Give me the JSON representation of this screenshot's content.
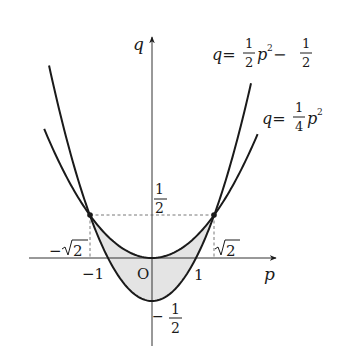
{
  "diagram": {
    "type": "function-graph",
    "axes": {
      "x_label": "p",
      "y_label": "q",
      "origin_label": "O"
    },
    "curves": [
      {
        "name": "steep-parabola",
        "equation_lhs": "q=",
        "coef_num": "1",
        "coef_den": "2",
        "var": "p",
        "exp": "2",
        "minus": "−",
        "const_num": "1",
        "const_den": "2",
        "formula": "q = 1/2 p^2 - 1/2"
      },
      {
        "name": "shallow-parabola",
        "equation_lhs": "q=",
        "coef_num": "1",
        "coef_den": "4",
        "var": "p",
        "exp": "2",
        "formula": "q = 1/4 p^2"
      }
    ],
    "tick_labels": {
      "x_neg_one": "−1",
      "x_one": "1",
      "x_neg_sqrt2_sign": "−",
      "x_neg_sqrt2_radicand": "2",
      "x_sqrt2_radicand": "2",
      "y_half_num": "1",
      "y_half_den": "2",
      "y_neg_half_sign": "−",
      "y_neg_half_num": "1",
      "y_neg_half_den": "2"
    },
    "intersections": [
      {
        "p": "-√2",
        "q": "1/2"
      },
      {
        "p": "√2",
        "q": "1/2"
      }
    ],
    "shaded_region": "between curves for -√2 ≤ p ≤ √2",
    "colors": {
      "stroke": "#1a1a1a",
      "shade": "#e4e4e4",
      "axis": "#333333",
      "dashed": "#555555"
    }
  }
}
